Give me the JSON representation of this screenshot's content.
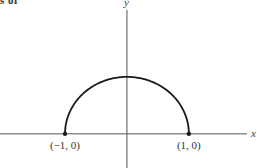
{
  "cropped_text": "s of",
  "chart_data": {
    "type": "line",
    "title": "",
    "xlabel": "x",
    "ylabel": "y",
    "function": "y = sqrt(1 - x^2)",
    "xlim": [
      -2.05,
      2.1
    ],
    "ylim": [
      -0.6,
      2.35
    ],
    "series": [
      {
        "name": "upper semicircle",
        "x": [
          -1,
          -0.9,
          -0.75,
          -0.5,
          -0.25,
          0,
          0.25,
          0.5,
          0.75,
          0.9,
          1
        ],
        "y": [
          0,
          0.436,
          0.661,
          0.866,
          0.968,
          1,
          0.968,
          0.866,
          0.661,
          0.436,
          0
        ]
      }
    ],
    "points": [
      {
        "x": -1,
        "y": 0,
        "label": "(−1, 0)"
      },
      {
        "x": 1,
        "y": 0,
        "label": "(1, 0)"
      }
    ],
    "grid": false,
    "legend": "none"
  }
}
